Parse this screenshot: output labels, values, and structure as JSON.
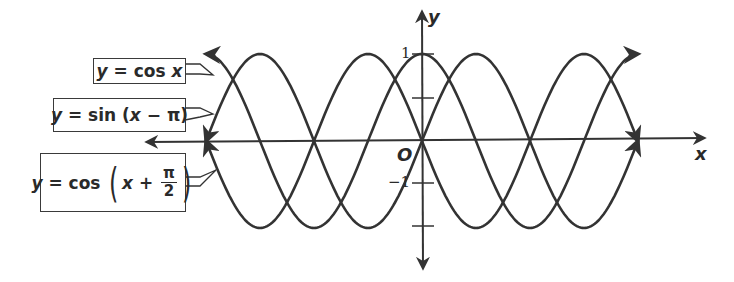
{
  "chart_data": {
    "type": "line",
    "title": "",
    "xlabel": "x",
    "ylabel": "y",
    "origin_label": "O",
    "xlim": [
      "-2π",
      "2π"
    ],
    "ylim": [
      -1,
      1
    ],
    "grid": false,
    "y_tick_labels": [
      "1",
      "-1"
    ],
    "series": [
      {
        "name": "y = cos x",
        "function": "cos(x)",
        "x_range": [
          "-2π",
          "2π"
        ],
        "points": [
          [
            -6.283,
            1
          ],
          [
            -4.712,
            0
          ],
          [
            -3.142,
            -1
          ],
          [
            -1.571,
            0
          ],
          [
            0,
            1
          ],
          [
            1.571,
            0
          ],
          [
            3.142,
            -1
          ],
          [
            4.712,
            0
          ],
          [
            6.283,
            1
          ]
        ]
      },
      {
        "name": "y = sin (x − π)",
        "function": "sin(x - π)",
        "x_range": [
          "-2π",
          "2π"
        ],
        "points": [
          [
            -6.283,
            0
          ],
          [
            -4.712,
            -1
          ],
          [
            -3.142,
            0
          ],
          [
            -1.571,
            1
          ],
          [
            0,
            0
          ],
          [
            1.571,
            -1
          ],
          [
            3.142,
            0
          ],
          [
            4.712,
            1
          ],
          [
            6.283,
            0
          ]
        ]
      },
      {
        "name": "y = cos (x + π/2)",
        "function": "sin(x)",
        "x_range": [
          "-2π",
          "2π"
        ],
        "points": [
          [
            -6.283,
            0
          ],
          [
            -4.712,
            1
          ],
          [
            -3.142,
            0
          ],
          [
            -1.571,
            -1
          ],
          [
            0,
            0
          ],
          [
            1.571,
            1
          ],
          [
            3.142,
            0
          ],
          [
            4.712,
            -1
          ],
          [
            6.283,
            0
          ]
        ]
      }
    ],
    "annotations": [
      "y = cos x",
      "y = sin (x − π)",
      "y = cos (x + π/2)"
    ]
  },
  "labels": {
    "cos": {
      "y": "y",
      "eq": " = cos ",
      "x": "x"
    },
    "sin": {
      "y": "y",
      "eq": " = sin (",
      "x": "x",
      "rest": " − π)"
    },
    "cos_shift": {
      "y": "y",
      "eq": " = cos ",
      "x": "x",
      "plus": " + ",
      "num": "π",
      "den": "2"
    }
  },
  "axes": {
    "x_label": "x",
    "y_label": "y",
    "origin": "O",
    "tick_pos": "1",
    "tick_neg": "−1"
  },
  "colors": {
    "curve": "#333333",
    "axis": "#333333",
    "background": "#ffffff"
  }
}
